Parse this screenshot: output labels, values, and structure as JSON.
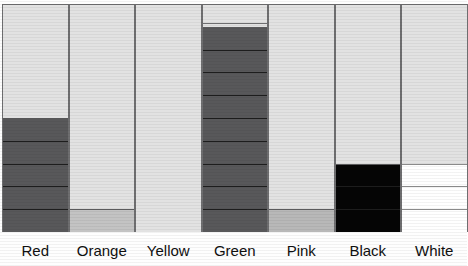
{
  "chart_data": {
    "type": "bar",
    "title": "",
    "subtitle": "",
    "xlabel": "",
    "ylabel": "",
    "grid": false,
    "legend": "none",
    "orientation": "vertical",
    "stacked": true,
    "axis_visible": false,
    "ylim": [
      0,
      10
    ],
    "categories": [
      "Red",
      "Orange",
      "Yellow",
      "Green",
      "Pink",
      "Black",
      "White"
    ],
    "values": [
      5,
      1,
      0,
      9,
      1,
      3,
      3
    ],
    "series": [
      {
        "name": "Filled segments",
        "values": [
          5,
          1,
          0,
          9,
          1,
          3,
          3
        ]
      }
    ],
    "columns": [
      {
        "label": "Red",
        "filled": 5,
        "fill_color": "#58585a",
        "empty_color": "#e2e2e2",
        "top_strip": false
      },
      {
        "label": "Orange",
        "filled": 1,
        "fill_color": "#c3c3c3",
        "empty_color": "#e2e2e2",
        "top_strip": false
      },
      {
        "label": "Yellow",
        "filled": 0,
        "fill_color": "#e2e2e2",
        "empty_color": "#e2e2e2",
        "top_strip": false
      },
      {
        "label": "Green",
        "filled": 9,
        "fill_color": "#58585a",
        "empty_color": "#e2e2e2",
        "top_strip": true
      },
      {
        "label": "Pink",
        "filled": 1,
        "fill_color": "#b8b8b8",
        "empty_color": "#e2e2e2",
        "top_strip": false
      },
      {
        "label": "Black",
        "filled": 3,
        "fill_color": "#050505",
        "empty_color": "#e2e2e2",
        "top_strip": false
      },
      {
        "label": "White",
        "filled": 3,
        "fill_color": "#ffffff",
        "empty_color": "#e2e2e2",
        "top_strip": false
      }
    ]
  },
  "colors": {
    "background": "#fefefe",
    "cell_empty": "#e2e2e2",
    "cell_dark": "#58585a",
    "cell_black": "#050505",
    "cell_white": "#ffffff",
    "cell_mid_gray": "#c3c3c3",
    "cell_pink_gray": "#b8b8b8",
    "border": "#6e6e70",
    "segment_divider": "#1d1d1d",
    "label_text": "#0f0f0f"
  },
  "layout": {
    "plot_top": 4,
    "plot_height": 228,
    "column_width": 66.5,
    "column_left_offsets": [
      2,
      68.5,
      135,
      201.5,
      268,
      334.5,
      401
    ],
    "label_row_top": 234,
    "unit_height": 22.8
  }
}
